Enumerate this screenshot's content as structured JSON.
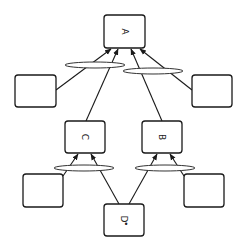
{
  "diagram": {
    "nodes": [
      {
        "id": "A",
        "label": "A",
        "x": 104,
        "y": 15,
        "w": 41,
        "h": 33
      },
      {
        "id": "left-top",
        "label": "",
        "x": 15,
        "y": 75,
        "w": 41,
        "h": 32
      },
      {
        "id": "right-top",
        "label": "",
        "x": 192,
        "y": 75,
        "w": 40,
        "h": 32
      },
      {
        "id": "C",
        "label": "C",
        "x": 65,
        "y": 121,
        "w": 40,
        "h": 32
      },
      {
        "id": "B",
        "label": "B",
        "x": 142,
        "y": 121,
        "w": 40,
        "h": 32
      },
      {
        "id": "left-bottom",
        "label": "",
        "x": 23,
        "y": 174,
        "w": 40,
        "h": 33
      },
      {
        "id": "right-bottom",
        "label": "",
        "x": 184,
        "y": 174,
        "w": 40,
        "h": 33
      },
      {
        "id": "D",
        "label": "D",
        "x": 104,
        "y": 204,
        "w": 40,
        "h": 32
      }
    ],
    "label_rotation_deg": 90,
    "d_marker": "•",
    "edges": [
      {
        "from": "left-top",
        "to": "A"
      },
      {
        "from": "C",
        "to": "A"
      },
      {
        "from": "B",
        "to": "A"
      },
      {
        "from": "right-top",
        "to": "A"
      },
      {
        "from": "left-bottom",
        "to": "C"
      },
      {
        "from": "D",
        "to": "C"
      },
      {
        "from": "D",
        "to": "B"
      },
      {
        "from": "right-bottom",
        "to": "B"
      }
    ],
    "junctions": [
      {
        "name": "junction-a-left",
        "cx": 95,
        "cy": 65,
        "rx": 30,
        "ry": 3
      },
      {
        "name": "junction-a-right",
        "cx": 153,
        "cy": 71,
        "rx": 30,
        "ry": 3
      },
      {
        "name": "junction-c",
        "cx": 84,
        "cy": 168,
        "rx": 30,
        "ry": 3
      },
      {
        "name": "junction-b",
        "cx": 165,
        "cy": 168,
        "rx": 30,
        "ry": 3
      }
    ],
    "stroke_color": "#1a1a1a",
    "background": "#ffffff"
  }
}
